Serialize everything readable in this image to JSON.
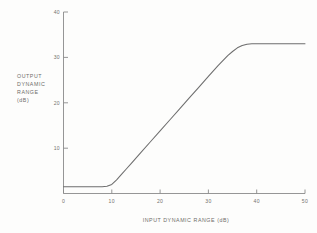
{
  "chart_data": {
    "type": "line",
    "title": "",
    "xlabel": "INPUT DYNAMIC RANGE (dB)",
    "ylabel_lines": [
      "OUTPUT",
      "DYNAMIC",
      "RANGE",
      "(dB)"
    ],
    "xlim": [
      0,
      50
    ],
    "ylim": [
      0,
      40
    ],
    "xticks": [
      0,
      10,
      20,
      30,
      40,
      50
    ],
    "xtick_labels": [
      "0",
      "10",
      "20",
      "30",
      "40",
      "50"
    ],
    "yticks": [
      10,
      20,
      30,
      40
    ],
    "ytick_labels": [
      "10",
      "20",
      "30",
      "40"
    ],
    "grid": false,
    "legend": "none",
    "series": [
      {
        "name": "transfer curve",
        "color": "#6e6e6e",
        "x": [
          0,
          2,
          4,
          6,
          8,
          9,
          10,
          11,
          12,
          13,
          14,
          16,
          18,
          20,
          22,
          24,
          26,
          28,
          30,
          32,
          34,
          35,
          36,
          37,
          38,
          39,
          40,
          42,
          44,
          46,
          48,
          50
        ],
        "y": [
          1.5,
          1.5,
          1.5,
          1.5,
          1.5,
          1.6,
          2.0,
          3.0,
          4.2,
          5.4,
          6.6,
          9.0,
          11.4,
          13.8,
          16.2,
          18.6,
          21.0,
          23.4,
          25.8,
          28.2,
          30.4,
          31.3,
          32.1,
          32.6,
          32.9,
          33.0,
          33.0,
          33.0,
          33.0,
          33.0,
          33.0,
          33.0
        ]
      }
    ],
    "annotations": {
      "noise_floor_db": 1.5,
      "lower_knee_db": 10,
      "upper_knee_db": 37,
      "saturation_level_db": 33
    }
  },
  "figure": {
    "background_color": "#fdfdfc",
    "axis_color": "#8a8a8a",
    "text_color": "#74736f"
  }
}
